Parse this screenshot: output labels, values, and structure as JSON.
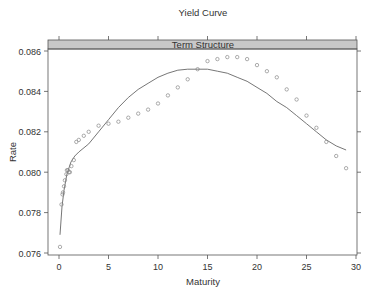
{
  "chart_data": {
    "type": "scatter",
    "title": "Yield Curve",
    "panel_strip": "Term Structure",
    "xlabel": "Maturity",
    "ylabel": "Rate",
    "xlim": [
      -1.2,
      31.2
    ],
    "ylim": [
      0.0759,
      0.0865
    ],
    "x_ticks": [
      0,
      5,
      10,
      15,
      20,
      25,
      30
    ],
    "x_tick_labels": [
      "0",
      "5",
      "10",
      "15",
      "20",
      "25",
      "30"
    ],
    "y_ticks": [
      0.076,
      0.078,
      0.08,
      0.082,
      0.084,
      0.086
    ],
    "y_tick_labels": [
      "0.076",
      "0.078",
      "0.080",
      "0.082",
      "0.084",
      "0.086"
    ],
    "grid": false,
    "series": [
      {
        "name": "observed",
        "kind": "points",
        "marker": "open-circle",
        "x": [
          0.1,
          0.25,
          0.35,
          0.4,
          0.5,
          0.6,
          0.75,
          0.8,
          0.9,
          1.0,
          1.1,
          1.25,
          1.5,
          1.75,
          2.0,
          2.5,
          3.0,
          4.0,
          5.0,
          6.0,
          7.0,
          8.0,
          9.0,
          10.0,
          11.0,
          12.0,
          13.0,
          14.0,
          15.0,
          16.0,
          17.0,
          18.0,
          19.0,
          20.0,
          21.0,
          22.0,
          23.0,
          24.0,
          25.0,
          26.0,
          27.0,
          28.0,
          29.0
        ],
        "y": [
          0.0763,
          0.0784,
          0.0789,
          0.079,
          0.0793,
          0.0796,
          0.0799,
          0.0801,
          0.0801,
          0.08,
          0.08,
          0.0803,
          0.0806,
          0.0815,
          0.0816,
          0.0818,
          0.082,
          0.0823,
          0.0824,
          0.0825,
          0.0827,
          0.0829,
          0.0831,
          0.0834,
          0.0838,
          0.0842,
          0.0846,
          0.0851,
          0.0855,
          0.0856,
          0.0857,
          0.0857,
          0.0856,
          0.0853,
          0.085,
          0.0847,
          0.0841,
          0.0836,
          0.0828,
          0.0822,
          0.0815,
          0.0808,
          0.0802
        ]
      },
      {
        "name": "fitted",
        "kind": "line",
        "x": [
          0.1,
          0.3,
          0.5,
          0.8,
          1.2,
          1.6,
          2.0,
          3.0,
          4.0,
          5.0,
          6.0,
          7.0,
          8.0,
          9.0,
          10.0,
          11.0,
          12.0,
          13.0,
          14.0,
          15.0,
          16.0,
          17.0,
          18.0,
          19.0,
          20.0,
          21.0,
          22.0,
          23.0,
          24.0,
          25.0,
          26.0,
          27.0,
          28.0,
          29.0
        ],
        "y": [
          0.0769,
          0.0783,
          0.0791,
          0.0799,
          0.0805,
          0.0808,
          0.081,
          0.0814,
          0.082,
          0.0826,
          0.0832,
          0.0837,
          0.0841,
          0.0844,
          0.0847,
          0.0849,
          0.08505,
          0.0851,
          0.0851,
          0.0851,
          0.085,
          0.0849,
          0.0847,
          0.0845,
          0.0842,
          0.0839,
          0.0835,
          0.0832,
          0.0828,
          0.0824,
          0.082,
          0.0816,
          0.0813,
          0.0811
        ]
      }
    ]
  },
  "colors": {
    "strip_fill": "#c8c8c8",
    "axis": "#555555",
    "points": "#888888",
    "line": "#666666",
    "text": "#333333"
  }
}
